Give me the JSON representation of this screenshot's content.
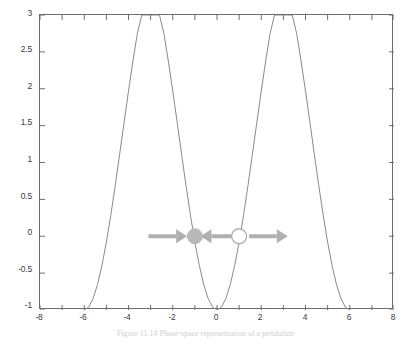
{
  "figure": {
    "caption": "Figure 11.14  Phase-space representation of a pendulum",
    "background_color": "#ffffff",
    "frame_color": "#6d6d6d",
    "curve_color": "#8a8a8a",
    "annotation_color": "#b0b0b0",
    "marker_fill_color": "#b9b9b9",
    "marker_open_color": "#ffffff"
  },
  "chart_data": {
    "type": "line",
    "title": "",
    "xlabel": "",
    "ylabel": "",
    "xlim": [
      -8,
      8
    ],
    "ylim": [
      -1,
      3
    ],
    "grid": false,
    "legend": null,
    "x_ticks": [
      -8,
      -6,
      -4,
      -2,
      0,
      2,
      4,
      6,
      8
    ],
    "x_tick_labels": [
      "-8",
      "-6",
      "-4",
      "-2",
      "0",
      "2",
      "4",
      "6",
      "8"
    ],
    "x_minor_ticks": [
      -7,
      -5,
      -3,
      -1,
      1,
      3,
      5,
      7
    ],
    "y_ticks": [
      -1,
      -0.5,
      0,
      0.5,
      1,
      1.5,
      2,
      2.5,
      3
    ],
    "y_tick_labels": [
      "-1",
      "-0.5",
      "0",
      "0.5",
      "1",
      "1.5",
      "2",
      "2.5",
      "3"
    ],
    "series": [
      {
        "name": "curve",
        "expression": "y = 1 - 2*cos(pi*x/3)",
        "clipped_to_ylim": true,
        "x": [
          -6.0,
          -5.8,
          -5.6,
          -5.4,
          -5.2,
          -5.0,
          -4.8,
          -4.6,
          -4.4,
          -4.2,
          -4.0,
          -3.8,
          -3.6,
          -3.4,
          -3.2,
          -3.0,
          -2.8,
          -2.6,
          -2.4,
          -2.2,
          -2.0,
          -1.8,
          -1.6,
          -1.4,
          -1.2,
          -1.0,
          -0.8,
          -0.6,
          -0.4,
          -0.2,
          0.0,
          0.2,
          0.4,
          0.6,
          0.8,
          1.0,
          1.2,
          1.4,
          1.6,
          1.8,
          2.0,
          2.2,
          2.4,
          2.6,
          2.8,
          3.0,
          3.2,
          3.4,
          3.6,
          3.8,
          4.0,
          4.2,
          4.4,
          4.6,
          4.8,
          5.0,
          5.2,
          5.4,
          5.6,
          5.8,
          6.0
        ],
        "y": [
          -1.0,
          -0.961,
          -0.844,
          -0.654,
          -0.396,
          -0.079,
          0.286,
          0.687,
          1.111,
          1.543,
          1.969,
          2.376,
          2.75,
          3.0,
          3.0,
          3.0,
          3.0,
          3.0,
          2.75,
          2.376,
          1.969,
          1.543,
          1.111,
          0.687,
          0.286,
          -0.079,
          -0.396,
          -0.654,
          -0.844,
          -0.961,
          -1.0,
          -0.961,
          -0.844,
          -0.654,
          -0.396,
          -0.079,
          0.286,
          0.687,
          1.111,
          1.543,
          1.969,
          2.376,
          2.75,
          3.0,
          3.0,
          3.0,
          3.0,
          3.0,
          2.75,
          2.376,
          1.969,
          1.543,
          1.111,
          0.687,
          0.286,
          -0.079,
          -0.396,
          -0.654,
          -0.844,
          -0.961,
          -1.0
        ]
      }
    ],
    "annotations": {
      "markers": [
        {
          "id": "stable-point",
          "label": "filled-circle",
          "style": "filled",
          "x": -1.0,
          "y": 0.0
        },
        {
          "id": "unstable-point",
          "label": "open-circle",
          "style": "open",
          "x": 1.0,
          "y": 0.0
        }
      ],
      "arrows": [
        {
          "id": "arrow-left-inward",
          "direction": "right",
          "y": 0.0,
          "x_start": -3.1,
          "x_end": -1.35
        },
        {
          "id": "arrow-middle-inward",
          "direction": "left",
          "y": 0.0,
          "x_start": 0.65,
          "x_end": -0.75
        },
        {
          "id": "arrow-right-outward",
          "direction": "right",
          "y": 0.0,
          "x_start": 1.45,
          "x_end": 3.2
        }
      ]
    }
  }
}
